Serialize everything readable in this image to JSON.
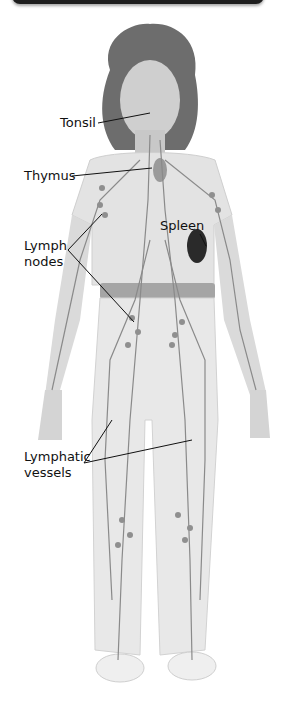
{
  "diagram": {
    "labels": {
      "tonsil": "Tonsil",
      "thymus": "Thymus",
      "spleen": "Spleen",
      "lymph_nodes_line1": "Lymph",
      "lymph_nodes_line2": "nodes",
      "lymphatic_vessels_line1": "Lymphatic",
      "lymphatic_vessels_line2": "vessels"
    },
    "colors": {
      "banner": "#1e1e1e",
      "figure_fill": "#e6e6e6",
      "vessel": "#8a8a8a",
      "spleen": "#2a2a2a",
      "text": "#111111"
    }
  }
}
